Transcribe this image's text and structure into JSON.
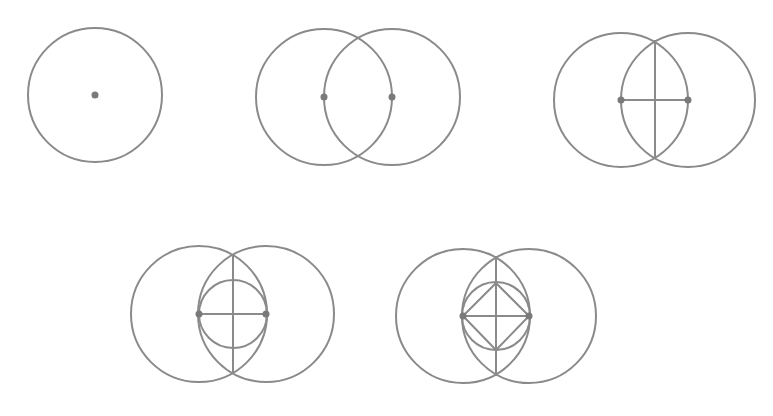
{
  "diagram": {
    "type": "geometric-construction",
    "colors": {
      "stroke": "#8a8a8a",
      "point": "#7a7a7a",
      "background": "#ffffff"
    },
    "stroke_width": 2,
    "point_radius": 3.5,
    "steps": [
      {
        "id": "step-1",
        "name": "single-circle",
        "circles": [
          {
            "cx": 95,
            "cy": 95,
            "r": 67
          }
        ],
        "points": [
          {
            "x": 95,
            "y": 95
          }
        ],
        "lines": []
      },
      {
        "id": "step-2",
        "name": "vesica-piscis",
        "circles": [
          {
            "cx": 324,
            "cy": 97,
            "r": 68
          },
          {
            "cx": 392,
            "cy": 97,
            "r": 68
          }
        ],
        "points": [
          {
            "x": 324,
            "y": 97
          },
          {
            "x": 392,
            "y": 97
          }
        ],
        "lines": []
      },
      {
        "id": "step-3",
        "name": "vesica-with-axes",
        "circles": [
          {
            "cx": 621,
            "cy": 100,
            "r": 67
          },
          {
            "cx": 688,
            "cy": 100,
            "r": 67
          }
        ],
        "points": [
          {
            "x": 621,
            "y": 100
          },
          {
            "x": 688,
            "y": 100
          }
        ],
        "lines": [
          {
            "x1": 621,
            "y1": 100,
            "x2": 688,
            "y2": 100
          },
          {
            "x1": 655,
            "y1": 40,
            "x2": 655,
            "y2": 159
          }
        ]
      },
      {
        "id": "step-4",
        "name": "vesica-with-inscribed-circle",
        "circles": [
          {
            "cx": 199,
            "cy": 314,
            "r": 68
          },
          {
            "cx": 266,
            "cy": 314,
            "r": 68
          },
          {
            "cx": 233,
            "cy": 314,
            "r": 34
          }
        ],
        "points": [
          {
            "x": 199,
            "y": 314
          },
          {
            "x": 266,
            "y": 314
          }
        ],
        "lines": [
          {
            "x1": 199,
            "y1": 314,
            "x2": 266,
            "y2": 314
          },
          {
            "x1": 233,
            "y1": 254,
            "x2": 233,
            "y2": 374
          }
        ]
      },
      {
        "id": "step-5",
        "name": "vesica-with-inscribed-square",
        "circles": [
          {
            "cx": 463,
            "cy": 316,
            "r": 67
          },
          {
            "cx": 529,
            "cy": 316,
            "r": 67
          },
          {
            "cx": 496,
            "cy": 316,
            "r": 34
          }
        ],
        "points": [
          {
            "x": 463,
            "y": 316
          },
          {
            "x": 529,
            "y": 316
          }
        ],
        "lines": [
          {
            "x1": 463,
            "y1": 316,
            "x2": 529,
            "y2": 316
          },
          {
            "x1": 496,
            "y1": 256,
            "x2": 496,
            "y2": 376
          }
        ],
        "polygons": [
          {
            "points": "463,316 496,283 529,316 496,350"
          }
        ]
      }
    ]
  }
}
